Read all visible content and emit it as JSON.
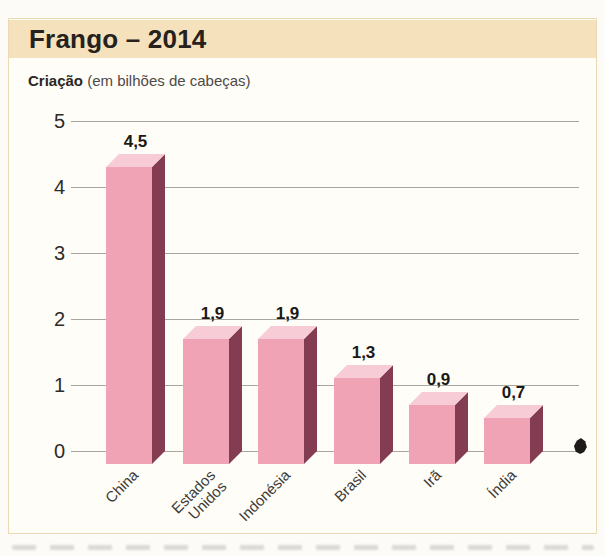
{
  "header": {
    "title": "Frango – 2014"
  },
  "subtitle": {
    "label": "Criação",
    "unit": " (em bilhões de cabeças)"
  },
  "colors": {
    "page_bg": "#fcfbf8",
    "card_bg": "#fffdf7",
    "card_border": "#ead9b2",
    "header_band": "#f5e2bc",
    "bar_front": "#f0a3b5",
    "bar_top": "#f8ccd6",
    "bar_side": "#843c52",
    "gridline": "#a9a6a0",
    "text": "#26211d"
  },
  "chart_data": {
    "type": "bar",
    "title": "Frango – 2014",
    "subtitle": "Criação (em bilhões de cabeças)",
    "xlabel": "",
    "ylabel": "em bilhões de cabeças",
    "categories": [
      "China",
      "Estados Unidos",
      "Indonésia",
      "Brasil",
      "Irã",
      "Índia"
    ],
    "categories_display": [
      "China",
      "Estados\nUnidos",
      "Indonésia",
      "Brasil",
      "Irã",
      "Índia"
    ],
    "values": [
      4.5,
      1.9,
      1.9,
      1.3,
      0.9,
      0.7
    ],
    "value_labels": [
      "4,5",
      "1,9",
      "1,9",
      "1,3",
      "0,9",
      "0,7"
    ],
    "ylim": [
      0,
      5
    ],
    "yticks": [
      0,
      1,
      2,
      3,
      4,
      5
    ],
    "grid": true,
    "legend": "none",
    "bar_style": "3d"
  }
}
